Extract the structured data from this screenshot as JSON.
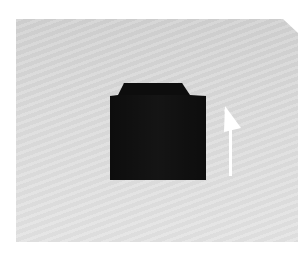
{
  "scene": {
    "description": "Folded black garment lying on a light gray textured surface with a white upward arrow to its right",
    "colors": {
      "background": "#ffffff",
      "surface": "#d9d9d9",
      "garment": "#0d0d0d",
      "arrow": "#ffffff"
    },
    "arrow_direction": "up"
  }
}
